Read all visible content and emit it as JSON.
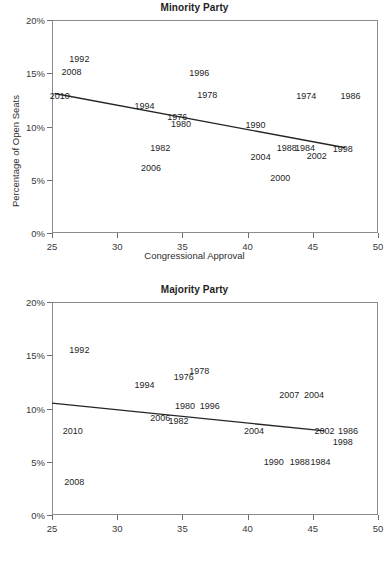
{
  "figure": {
    "axis_x_title": "Congressional Approval",
    "axis_y_title": "Percentage of Open Seats",
    "xticks": [
      "25",
      "30",
      "35",
      "40",
      "45",
      "50"
    ],
    "yticks": [
      "0%",
      "5%",
      "10%",
      "15%",
      "20%"
    ],
    "line_color": "#262626",
    "frame_color": "#8c8c8c",
    "text_color": "#242424"
  },
  "chart_data": [
    {
      "type": "scatter",
      "title": "Minority Party",
      "xlabel": "Congressional Approval",
      "ylabel": "Percentage of Open Seats",
      "xlim": [
        25,
        50
      ],
      "ylim": [
        0,
        20
      ],
      "xticks": [
        25,
        30,
        35,
        40,
        45,
        50
      ],
      "yticks": [
        0,
        5,
        10,
        15,
        20
      ],
      "ytick_labels": [
        "0%",
        "5%",
        "10%",
        "15%",
        "20%"
      ],
      "grid": false,
      "legend": "none",
      "point_label_field": "year",
      "points": [
        {
          "year": "1992",
          "x": 27.1,
          "y": 16.3
        },
        {
          "year": "2008",
          "x": 26.5,
          "y": 15.1
        },
        {
          "year": "2010",
          "x": 25.6,
          "y": 12.9
        },
        {
          "year": "1994",
          "x": 32.1,
          "y": 11.9
        },
        {
          "year": "1996",
          "x": 36.3,
          "y": 15.0
        },
        {
          "year": "1978",
          "x": 36.9,
          "y": 13.0
        },
        {
          "year": "1974",
          "x": 44.5,
          "y": 12.9
        },
        {
          "year": "1986",
          "x": 47.9,
          "y": 12.9
        },
        {
          "year": "1976",
          "x": 34.6,
          "y": 10.9
        },
        {
          "year": "1980",
          "x": 34.9,
          "y": 10.2
        },
        {
          "year": "1990",
          "x": 40.6,
          "y": 10.1
        },
        {
          "year": "1982",
          "x": 33.3,
          "y": 8.0
        },
        {
          "year": "1988",
          "x": 43.0,
          "y": 8.0
        },
        {
          "year": "1984",
          "x": 44.4,
          "y": 8.0
        },
        {
          "year": "1998",
          "x": 47.3,
          "y": 7.9
        },
        {
          "year": "2002",
          "x": 45.3,
          "y": 7.2
        },
        {
          "year": "2004",
          "x": 41.0,
          "y": 7.1
        },
        {
          "year": "2006",
          "x": 32.6,
          "y": 6.1
        },
        {
          "year": "2000",
          "x": 42.5,
          "y": 5.2
        }
      ],
      "fit_line": {
        "x0": 25.2,
        "y0": 13.1,
        "x1": 47.5,
        "y1": 8.0
      }
    },
    {
      "type": "scatter",
      "title": "Majority Party",
      "xlabel": "Congressional Approval",
      "ylabel": "Percentage of Open Seats",
      "xlim": [
        25,
        50
      ],
      "ylim": [
        0,
        20
      ],
      "xticks": [
        25,
        30,
        35,
        40,
        45,
        50
      ],
      "yticks": [
        0,
        5,
        10,
        15,
        20
      ],
      "ytick_labels": [
        "0%",
        "5%",
        "10%",
        "15%",
        "20%"
      ],
      "grid": false,
      "legend": "none",
      "point_label_field": "year",
      "points": [
        {
          "year": "1992",
          "x": 27.1,
          "y": 15.5
        },
        {
          "year": "1978",
          "x": 36.3,
          "y": 13.5
        },
        {
          "year": "1976",
          "x": 35.1,
          "y": 13.0
        },
        {
          "year": "1994",
          "x": 32.1,
          "y": 12.2
        },
        {
          "year": "2007",
          "x": 43.2,
          "y": 11.3
        },
        {
          "year": "2004",
          "x": 45.1,
          "y": 11.3
        },
        {
          "year": "1980",
          "x": 35.2,
          "y": 10.2
        },
        {
          "year": "1996",
          "x": 37.1,
          "y": 10.2
        },
        {
          "year": "2006",
          "x": 33.3,
          "y": 9.1
        },
        {
          "year": "1982",
          "x": 34.7,
          "y": 8.8
        },
        {
          "year": "2010",
          "x": 26.6,
          "y": 7.9
        },
        {
          "year": "2004b",
          "x": 40.5,
          "y": 7.9
        },
        {
          "year": "2002",
          "x": 45.9,
          "y": 7.9
        },
        {
          "year": "1986",
          "x": 47.7,
          "y": 7.9
        },
        {
          "year": "1998",
          "x": 47.3,
          "y": 6.9
        },
        {
          "year": "1990",
          "x": 42.0,
          "y": 5.0
        },
        {
          "year": "1988",
          "x": 44.0,
          "y": 5.0
        },
        {
          "year": "1984",
          "x": 45.6,
          "y": 5.0
        },
        {
          "year": "2008",
          "x": 26.7,
          "y": 3.1
        }
      ],
      "fit_line": {
        "x0": 25.0,
        "y0": 10.5,
        "x1": 45.9,
        "y1": 7.9
      }
    }
  ]
}
